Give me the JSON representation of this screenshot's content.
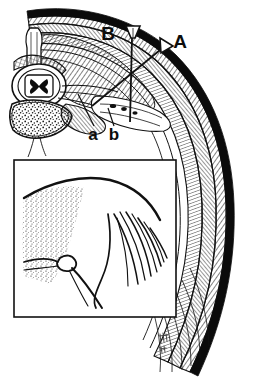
{
  "figure": {
    "type": "anatomical-line-drawing",
    "background_color": "#ffffff",
    "ink_color": "#111111",
    "width": 258,
    "height": 382
  },
  "labels": {
    "needle_a": "A",
    "needle_b": "B",
    "structure_a": "a",
    "structure_b": "b"
  },
  "label_positions": {
    "needle_a": {
      "x": 178,
      "y": 44
    },
    "needle_b": {
      "x": 113,
      "y": 38
    },
    "structure_a": {
      "x": 91,
      "y": 136
    },
    "structure_b": {
      "x": 112,
      "y": 136
    }
  },
  "needles": {
    "a": {
      "name": "oblique-needle",
      "label": "A",
      "hub_x": 163,
      "hub_y": 48,
      "tip_x": 92,
      "tip_y": 106,
      "orientation": "oblique"
    },
    "b": {
      "name": "perpendicular-needle",
      "label": "B",
      "hub_x": 133,
      "hub_y": 33,
      "tip_x": 130,
      "tip_y": 122,
      "orientation": "perpendicular"
    }
  },
  "leader_lines": {
    "structure_a": {
      "from_x": 94,
      "from_y": 128,
      "to_x": 78,
      "to_y": 95
    },
    "structure_b": {
      "from_x": 114,
      "from_y": 128,
      "to_x": 107,
      "to_y": 110
    }
  },
  "inset": {
    "name": "detail-inset",
    "border_color": "#111111",
    "x": 14,
    "y": 160,
    "width": 162,
    "height": 157,
    "content": "magnified detail of stippled bone surface, smooth curved membrane and fanned nerve fibres"
  },
  "signature": {
    "text": "ħħ",
    "x": 163,
    "y": 341
  },
  "anatomy_parts": [
    {
      "name": "skin-layer",
      "style": "solid-black-band"
    },
    {
      "name": "subcutaneous-layer",
      "style": "fine-hatch"
    },
    {
      "name": "intercostal-muscle-layer",
      "style": "cross-hatch"
    },
    {
      "name": "rib",
      "style": "outlined-band"
    },
    {
      "name": "vertebral-body",
      "style": "stippled"
    },
    {
      "name": "spinal-canal",
      "style": "outlined"
    },
    {
      "name": "spinal-cord-gray-matter",
      "style": "solid-butterfly"
    },
    {
      "name": "spinous-process",
      "style": "outlined"
    },
    {
      "name": "transverse-process",
      "style": "hatched"
    },
    {
      "name": "paravertebral-space",
      "style": "hatched"
    },
    {
      "name": "pleura",
      "style": "thin-line"
    }
  ]
}
